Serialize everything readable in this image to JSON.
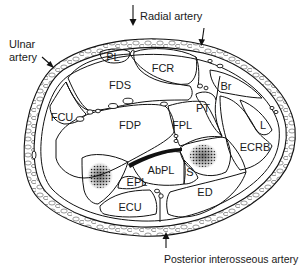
{
  "external_labels": {
    "radial_artery": "Radial artery",
    "ulnar_artery_line1": "Ulnar",
    "ulnar_artery_line2": "artery",
    "posterior_interosseous_artery": "Posterior interosseous artery"
  },
  "structures": [
    {
      "id": "PL",
      "label": "PL",
      "x": 113,
      "y": 57
    },
    {
      "id": "FCR",
      "label": "FCR",
      "x": 163,
      "y": 68
    },
    {
      "id": "FDS",
      "label": "FDS",
      "x": 120,
      "y": 85
    },
    {
      "id": "Br",
      "label": "Br",
      "x": 226,
      "y": 86
    },
    {
      "id": "PT",
      "label": "PT",
      "x": 203,
      "y": 108
    },
    {
      "id": "FCU",
      "label": "FCU",
      "x": 62,
      "y": 117
    },
    {
      "id": "FDP",
      "label": "FDP",
      "x": 130,
      "y": 125
    },
    {
      "id": "FPL",
      "label": "FPL",
      "x": 182,
      "y": 125
    },
    {
      "id": "L",
      "label": "L",
      "x": 263,
      "y": 125
    },
    {
      "id": "ECRB",
      "label": "ECRB",
      "x": 255,
      "y": 147
    },
    {
      "id": "AbPL",
      "label": "AbPL",
      "x": 161,
      "y": 170
    },
    {
      "id": "S",
      "label": "S",
      "x": 190,
      "y": 172
    },
    {
      "id": "EPL",
      "label": "EPL",
      "x": 137,
      "y": 182
    },
    {
      "id": "ED",
      "label": "ED",
      "x": 205,
      "y": 192
    },
    {
      "id": "ECU",
      "label": "ECU",
      "x": 130,
      "y": 207
    }
  ],
  "colors": {
    "line": "#111111",
    "background": "#ffffff",
    "bone_stipple": "#222222"
  }
}
